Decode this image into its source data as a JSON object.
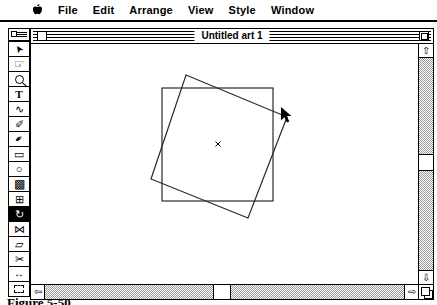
{
  "menubar": {
    "apple_icon": "apple-logo",
    "items": [
      {
        "label": "File"
      },
      {
        "label": "Edit"
      },
      {
        "label": "Arrange"
      },
      {
        "label": "View"
      },
      {
        "label": "Style"
      },
      {
        "label": "Window"
      }
    ]
  },
  "window": {
    "title": "Untitled art 1"
  },
  "palette": {
    "tools": [
      {
        "name": "selection-arrow",
        "selected": false
      },
      {
        "name": "hand",
        "selected": false
      },
      {
        "name": "zoom",
        "selected": false
      },
      {
        "name": "type",
        "selected": false
      },
      {
        "name": "freehand",
        "selected": false
      },
      {
        "name": "autotrace",
        "selected": false
      },
      {
        "name": "pen",
        "selected": false
      },
      {
        "name": "rectangle",
        "selected": false
      },
      {
        "name": "oval",
        "selected": false
      },
      {
        "name": "blend",
        "selected": false
      },
      {
        "name": "scale",
        "selected": false
      },
      {
        "name": "rotate",
        "selected": true
      },
      {
        "name": "reflect",
        "selected": false
      },
      {
        "name": "shear",
        "selected": false
      },
      {
        "name": "scissors",
        "selected": false
      },
      {
        "name": "measure",
        "selected": false
      },
      {
        "name": "page",
        "selected": false
      }
    ]
  },
  "canvas": {
    "original_square": {
      "x": 131,
      "y": 44,
      "width": 111,
      "height": 113
    },
    "rotated_square_points": "155,31 256,73 217,174 120,135",
    "center_mark": {
      "x": 187,
      "y": 100
    },
    "cursor": {
      "x": 250,
      "y": 63
    },
    "stroke_color": "#2a2a2a"
  },
  "scrollbars": {
    "vertical": {
      "up_icon": "⇧",
      "down_icon": "⇩"
    },
    "horizontal": {
      "left_icon": "⇦",
      "right_icon": "⇨"
    }
  },
  "caption": "Figure 5-50"
}
